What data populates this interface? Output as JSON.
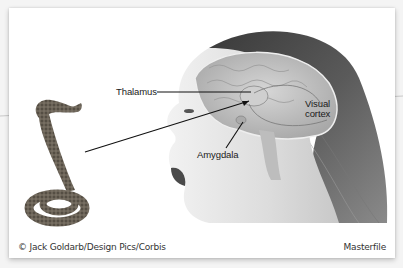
{
  "figure": {
    "labels": {
      "thalamus": "Thalamus",
      "visual_cortex_line1": "Visual",
      "visual_cortex_line2": "cortex",
      "amygdala": "Amygdala"
    },
    "credits": {
      "left": "© Jack Goldarb/Design Pics/Corbis",
      "right": "Masterfile"
    },
    "subjects": {
      "snake": "snake-illustration",
      "head": "woman-head-with-brain-cutaway"
    },
    "colors": {
      "background": "#f4f4f4",
      "card": "#ffffff",
      "label_text": "#1a1a1a",
      "leader_line": "#111111",
      "hair": "#2b2b2b",
      "skin": "#e6e6e6",
      "brain": "#bdbdbd"
    }
  }
}
